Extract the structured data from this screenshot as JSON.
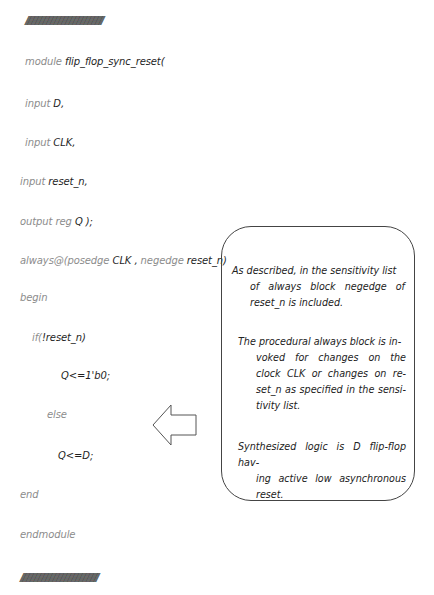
{
  "separator": "//////////////////////////////////////////////////////////////////////////////////",
  "code": {
    "line_module": {
      "kw": "module",
      "id": "flip_flop_sync_reset("
    },
    "line_input_d": {
      "kw": "input",
      "id": "D,"
    },
    "line_input_clk": {
      "kw": "input",
      "id": "CLK,"
    },
    "line_input_reset": {
      "kw": "input",
      "id": "reset_n,"
    },
    "line_output": {
      "kw": "output reg",
      "id": "Q );"
    },
    "line_always": {
      "kw1": "always@(posedge",
      "id1": "CLK ,",
      "kw2": "negedge",
      "id2": "reset_n)"
    },
    "line_begin": {
      "kw": "begin"
    },
    "line_if": {
      "kw": "if(",
      "id": "!reset_n)"
    },
    "line_assign_reset": {
      "id": "Q<=1'b0;"
    },
    "line_else": {
      "kw": "else"
    },
    "line_assign_d": {
      "id": "Q<=D;"
    },
    "line_end": {
      "kw": "end"
    },
    "line_endmodule": {
      "kw": "endmodule"
    }
  },
  "callout": {
    "p1": {
      "first": "As described, in the sensitivity list",
      "rest": "of always block negedge of reset_n is included."
    },
    "p2": {
      "first": "The procedural always block is in-",
      "rest": "voked for changes on the clock CLK or changes on re-set_n as specified in the sensi-tivity list."
    },
    "p3": {
      "first": "Synthesized logic is D flip-flop hav-",
      "rest": "ing active low asynchronous reset."
    }
  },
  "colors": {
    "keyword": "#8c8c8c",
    "identifier": "#1e1e1e",
    "border": "#444444"
  }
}
